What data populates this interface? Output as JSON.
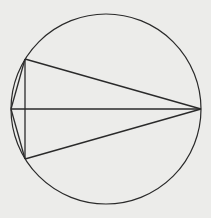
{
  "diagram": {
    "type": "geometry",
    "colors": {
      "background": "#ececea",
      "stroke": "#2a2a2a"
    },
    "circle": {
      "cx": 106,
      "cy": 109,
      "r": 95
    },
    "points": {
      "A": {
        "x": 11,
        "y": 109
      },
      "B": {
        "x": 201,
        "y": 109
      },
      "C": {
        "x": 25,
        "y": 59
      },
      "D": {
        "x": 25,
        "y": 159
      }
    },
    "segments": [
      [
        "A",
        "B"
      ],
      [
        "C",
        "B"
      ],
      [
        "D",
        "B"
      ],
      [
        "C",
        "D"
      ],
      [
        "A",
        "C"
      ],
      [
        "A",
        "D"
      ]
    ]
  }
}
